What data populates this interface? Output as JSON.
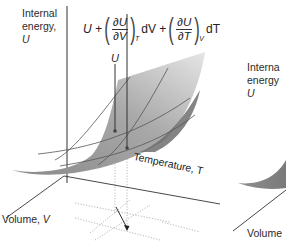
{
  "figure": {
    "left_panel": {
      "axis_labels": {
        "internal_energy_line1": "Internal",
        "internal_energy_line2": "energy,",
        "internal_energy_symbol": "U",
        "temperature": "Temperature, T",
        "volume_prefix": "Volume, ",
        "volume_symbol": "V"
      },
      "point_label": "U",
      "equation": {
        "lead": "U +",
        "term1_num": "∂U",
        "term1_den": "∂V",
        "term1_sub": "T",
        "term1_tail": "dV +",
        "term2_num": "∂U",
        "term2_den": "∂T",
        "term2_sub": "V",
        "term2_tail": "dT"
      }
    },
    "right_panel_partial": {
      "axis_labels": {
        "internal_energy_line1": "Interna",
        "internal_energy_line2": "energy",
        "internal_energy_symbol": "U",
        "volume": "Volume"
      }
    },
    "colors": {
      "surface_dark": "#8c8c8c",
      "surface_light": "#d9d9d9",
      "axis": "#333333",
      "grid_dotted": "#aaaaaa"
    }
  }
}
